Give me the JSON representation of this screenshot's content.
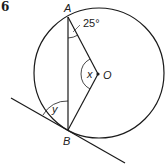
{
  "question_number": "6",
  "points": {
    "A": {
      "label": "A"
    },
    "B": {
      "label": "B"
    },
    "O": {
      "label": "O"
    }
  },
  "angles": {
    "at_A": {
      "label": "25°",
      "value_deg": 25
    },
    "at_O": {
      "label": "x"
    },
    "tangent_at_B": {
      "label": "y"
    }
  },
  "colors": {
    "stroke": "#1a1a1a",
    "background": "#ffffff"
  }
}
